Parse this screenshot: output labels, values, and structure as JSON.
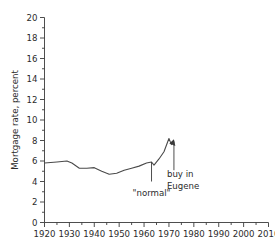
{
  "chart_data": {
    "type": "line",
    "title": "",
    "subtitle": "",
    "xlabel": "",
    "ylabel": "Mortgage rate, percent",
    "xlim": [
      1920,
      2010
    ],
    "ylim": [
      0,
      20
    ],
    "grid": false,
    "legend": false,
    "legend_position": "none",
    "x_ticks": [
      1920,
      1930,
      1940,
      1950,
      1960,
      1970,
      1980,
      1990,
      2000,
      2010
    ],
    "x_tick_labels": [
      "1920",
      "1930",
      "1940",
      "1950",
      "1960",
      "1970",
      "1980",
      "1990",
      "2000",
      "2010"
    ],
    "x_minor_tick_step": 5,
    "y_ticks": [
      0,
      2,
      4,
      6,
      8,
      10,
      12,
      14,
      16,
      18,
      20
    ],
    "y_tick_labels": [
      "0",
      "2",
      "4",
      "6",
      "8",
      "10",
      "12",
      "14",
      "16",
      "18",
      "20"
    ],
    "y_minor_tick_step": 1,
    "series": [
      {
        "name": "Mortgage rate",
        "color": "#4a4a4a",
        "x": [
          1920,
          1925,
          1929,
          1931,
          1934,
          1937,
          1940,
          1943,
          1946,
          1949,
          1952,
          1955,
          1958,
          1961,
          1963,
          1964,
          1966,
          1968,
          1970,
          1971
        ],
        "values": [
          5.8,
          5.9,
          6.0,
          5.8,
          5.3,
          5.3,
          5.35,
          5.0,
          4.7,
          4.8,
          5.1,
          5.3,
          5.5,
          5.8,
          5.9,
          5.6,
          6.2,
          6.9,
          8.2,
          7.6
        ]
      }
    ],
    "annotations": [
      {
        "id": "normal",
        "text": "\"normal\"",
        "x": 1963,
        "y_top": 5.9,
        "y_bottom": 4.0,
        "has_arrowhead": false
      },
      {
        "id": "buy-in-eugene",
        "text_lines": [
          "buy in",
          "Eugene"
        ],
        "x": 1972,
        "y_top": 7.9,
        "y_bottom": 5.1,
        "has_arrowhead": true,
        "arrow_points_to": "up"
      }
    ],
    "colors": {
      "line": "#4a4a4a",
      "axis": "#3a3a3a",
      "text": "#2b2b2b",
      "background": "#ffffff"
    }
  }
}
